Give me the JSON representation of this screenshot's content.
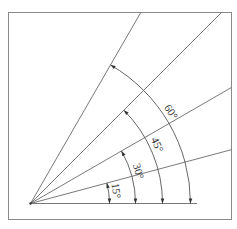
{
  "diagram": {
    "title": "",
    "type": "angle-construction",
    "rays_degrees": [
      0,
      15,
      30,
      45,
      60
    ],
    "angles": [
      {
        "value": 15,
        "label": "15°"
      },
      {
        "value": 30,
        "label": "30°"
      },
      {
        "value": 45,
        "label": "45°"
      },
      {
        "value": 60,
        "label": "60°"
      }
    ],
    "colors": {
      "line": "#6a6a6a",
      "text": "#333333",
      "frame": "#8a8a8a"
    }
  }
}
